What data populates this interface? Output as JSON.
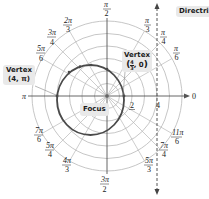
{
  "diagram": {
    "type": "polar-graph-conic",
    "pole": {
      "x": 107,
      "y": 96
    },
    "unit_px": 12.5,
    "grid_circles": [
      1,
      2,
      3,
      4,
      5,
      6
    ],
    "angle_labels": [
      {
        "id": "pi_over_2",
        "num": "π",
        "den": "2"
      },
      {
        "id": "pi_over_3",
        "num": "π",
        "den": "3"
      },
      {
        "id": "pi_over_4",
        "num": "π",
        "den": "4"
      },
      {
        "id": "pi_over_6",
        "num": "π",
        "den": "6"
      },
      {
        "id": "zero",
        "text": "0"
      },
      {
        "id": "11pi_over_6",
        "num": "11π",
        "den": "6"
      },
      {
        "id": "7pi_over_4",
        "num": "7π",
        "den": "4"
      },
      {
        "id": "5pi_over_3",
        "num": "5π",
        "den": "3"
      },
      {
        "id": "3pi_over_2",
        "num": "3π",
        "den": "2"
      },
      {
        "id": "4pi_over_3",
        "num": "4π",
        "den": "3"
      },
      {
        "id": "5pi_over_4",
        "num": "5π",
        "den": "4"
      },
      {
        "id": "7pi_over_6",
        "num": "7π",
        "den": "6"
      },
      {
        "id": "pi",
        "text": "π"
      },
      {
        "id": "5pi_over_6",
        "num": "5π",
        "den": "6"
      },
      {
        "id": "3pi_over_4",
        "num": "3π",
        "den": "4"
      },
      {
        "id": "2pi_over_3",
        "num": "2π",
        "den": "3"
      }
    ],
    "axis_tick_labels": {
      "r2": "2",
      "r4": "4"
    },
    "curve": {
      "equation": "r = 4/(2 + cos θ)",
      "eccentricity": 0.5,
      "color": "#4a4a4a"
    },
    "annotations": {
      "directrix": "Directrix",
      "focus": "Focus",
      "vertex_left": {
        "title": "Vertex",
        "coords": "(4, π)"
      },
      "vertex_right": {
        "title": "Vertex",
        "coords_num": "4",
        "coords_den": "3",
        "coords_rest": ", 0"
      }
    },
    "colors": {
      "grid": "#b5b5b5",
      "axis": "#555555",
      "curve": "#4a4a4a",
      "callout_bg": "#e9e9e9"
    }
  }
}
